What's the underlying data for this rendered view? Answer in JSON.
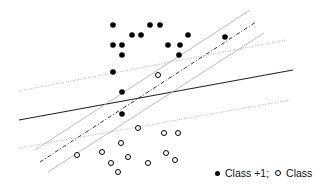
{
  "diagram": {
    "title": "",
    "points": {
      "class_pos": [
        [
          113,
          25
        ],
        [
          150,
          25
        ],
        [
          160,
          25
        ],
        [
          132,
          35
        ],
        [
          141,
          35
        ],
        [
          113,
          45
        ],
        [
          122,
          45
        ],
        [
          122,
          55
        ],
        [
          168,
          45
        ],
        [
          188,
          35
        ],
        [
          180,
          45
        ],
        [
          179,
          55
        ],
        [
          225,
          37
        ],
        [
          113,
          72
        ],
        [
          122,
          92
        ],
        [
          122,
          114
        ]
      ],
      "class_neg": [
        [
          158,
          75
        ],
        [
          138,
          128
        ],
        [
          164,
          133
        ],
        [
          178,
          133
        ],
        [
          121,
          143
        ],
        [
          77,
          155
        ],
        [
          102,
          152
        ],
        [
          128,
          157
        ],
        [
          111,
          163
        ],
        [
          148,
          163
        ],
        [
          166,
          153
        ],
        [
          175,
          160
        ],
        [
          118,
          172
        ]
      ]
    },
    "lines": [
      {
        "name": "solid-separator",
        "x1": 19,
        "y1": 120,
        "x2": 293,
        "y2": 70,
        "style": "solid",
        "color": "#222222",
        "width": 1.2
      },
      {
        "name": "dashed-separator",
        "x1": 40,
        "y1": 162,
        "x2": 256,
        "y2": 22,
        "style": "dashdot",
        "color": "#333333",
        "width": 1
      },
      {
        "name": "margin-upper",
        "x1": 35,
        "y1": 150,
        "x2": 250,
        "y2": 10,
        "style": "solid",
        "color": "#aaaaaa",
        "width": 0.8
      },
      {
        "name": "margin-lower",
        "x1": 48,
        "y1": 172,
        "x2": 264,
        "y2": 33,
        "style": "solid",
        "color": "#aaaaaa",
        "width": 0.8
      },
      {
        "name": "dotted-upper",
        "x1": 19,
        "y1": 91,
        "x2": 286,
        "y2": 40,
        "style": "dotted",
        "color": "#999999",
        "width": 0.8
      },
      {
        "name": "dotted-lower",
        "x1": 19,
        "y1": 148,
        "x2": 290,
        "y2": 100,
        "style": "dotted",
        "color": "#999999",
        "width": 0.8
      }
    ],
    "legend": {
      "pos_label": "Class +1;",
      "neg_label": "Class −1"
    }
  }
}
